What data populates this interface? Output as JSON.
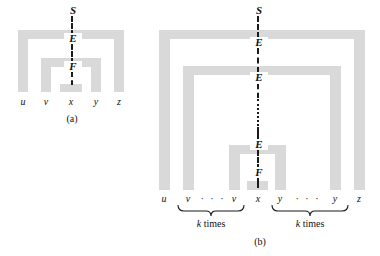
{
  "figure": {
    "background_color": "#ffffff",
    "arch_color": "#d9d9d9",
    "ink_color": "#1a1a1a",
    "subfigures": [
      {
        "caption": "(a)",
        "nonterminals": [
          "S",
          "E",
          "F"
        ],
        "terminals": [
          "u",
          "v",
          "x",
          "y",
          "z"
        ],
        "arch_count": 3
      },
      {
        "caption": "(b)",
        "nonterminals": [
          "S",
          "E",
          "E",
          "E",
          "F"
        ],
        "vertical_ellipsis": "⋮",
        "terminals": [
          "u",
          "v",
          "v",
          "x",
          "y",
          "y",
          "z"
        ],
        "horizontal_ellipsis": "· · ·",
        "arch_count": 3,
        "braces": [
          {
            "label_k": "k",
            "label_times": "times"
          },
          {
            "label_k": "k",
            "label_times": "times"
          }
        ]
      }
    ]
  },
  "fig_a": {
    "caption": "(a)",
    "nt": {
      "s": "S",
      "e": "E",
      "f": "F"
    },
    "terms": {
      "u": "u",
      "v": "v",
      "x": "x",
      "y": "y",
      "z": "z"
    }
  },
  "fig_b": {
    "caption": "(b)",
    "nt": {
      "s": "S",
      "e1": "E",
      "e2": "E",
      "e3": "E",
      "f": "F"
    },
    "terms": {
      "u": "u",
      "v1": "v",
      "v2": "v",
      "x": "x",
      "y1": "y",
      "y2": "y",
      "z": "z"
    },
    "ellipsis_left": "· · ·",
    "ellipsis_right": "· · ·",
    "brace_left": {
      "k": "k",
      "times": "times"
    },
    "brace_right": {
      "k": "k",
      "times": "times"
    }
  }
}
